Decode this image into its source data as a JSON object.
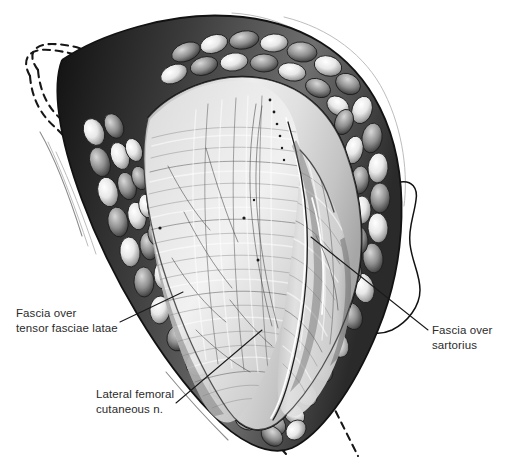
{
  "figure": {
    "title": "Surgical exposure of the anterior hip: interval between tensor fasciae latae and sartorius",
    "background_color": "#ffffff",
    "ink_color": "#1a1a1a",
    "width": 507,
    "height": 468,
    "style": "grayscale medical line-and-wash illustration"
  },
  "annotations": [
    {
      "id": "fascia-tfl",
      "line1": "Fascia over",
      "line2": "tensor fasciae latae",
      "text_x": 16,
      "text_y": 317,
      "align": "start",
      "leader": "M 120,322 L 183,292",
      "target_structure": "fascia overlying tensor fasciae latae muscle"
    },
    {
      "id": "fascia-sartorius",
      "line1": "Fascia over",
      "line2": "sartorius",
      "text_x": 432,
      "text_y": 334,
      "align": "start",
      "leader": "M 428,330 L 311,237",
      "target_structure": "fascia overlying sartorius muscle"
    },
    {
      "id": "lfcn",
      "line1": "Lateral femoral",
      "line2": "cutaneous n.",
      "text_x": 96,
      "text_y": 398,
      "align": "start",
      "leader": "M 176,403 L 262,330",
      "target_structure": "lateral femoral cutaneous nerve"
    }
  ],
  "structures": {
    "subcutaneous_fat": "retracted subcutaneous fat lobules lining the wound margins",
    "skin_flap": "retracted skin edges indicated by dashed contour lines",
    "deep_fascia": "exposed deep fascia of the thigh with longitudinal fiber striations",
    "intermuscular_interval": "groove marking the interval between tensor fasciae latae and sartorius"
  },
  "colors": {
    "background": "#ffffff",
    "ink": "#1a1a1a",
    "fascia_light": "#e4e4e4",
    "fascia_mid": "#c8c8c8",
    "fat_dark": "#2a2a2a",
    "fat_light": "#f2f2f2",
    "text": "#2b2b2b"
  }
}
